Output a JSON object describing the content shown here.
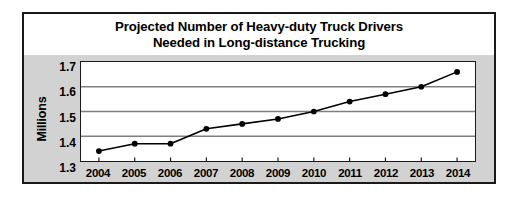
{
  "chart_data": {
    "type": "line",
    "title": "Projected Number of Heavy-duty Truck Drivers Needed in Long-distance Trucking",
    "title_lines": [
      "Projected Number of Heavy-duty Truck Drivers",
      "Needed in Long-distance Trucking"
    ],
    "xlabel": "",
    "ylabel": "Millions",
    "categories": [
      "2004",
      "2005",
      "2006",
      "2007",
      "2008",
      "2009",
      "2010",
      "2011",
      "2012",
      "2013",
      "2014"
    ],
    "values": [
      1.34,
      1.37,
      1.37,
      1.43,
      1.45,
      1.47,
      1.5,
      1.54,
      1.57,
      1.6,
      1.66
    ],
    "ylim": [
      1.3,
      1.7
    ],
    "yticks": [
      "1.3",
      "1.4",
      "1.5",
      "1.6",
      "1.7"
    ],
    "ytick_values": [
      1.3,
      1.4,
      1.5,
      1.6,
      1.7
    ],
    "grid": "horizontal",
    "legend": "none",
    "marker": "filled-circle",
    "series": [
      {
        "name": "Projected heavy-duty truck drivers",
        "values": [
          1.34,
          1.37,
          1.37,
          1.43,
          1.45,
          1.47,
          1.5,
          1.54,
          1.57,
          1.6,
          1.66
        ]
      }
    ],
    "colors": {
      "line": "#000000",
      "marker": "#000000",
      "grid": "#808080",
      "plot_background": "#ffffff",
      "figure_background": "#d2d2d2",
      "border": "#1a1a1a",
      "text": "#000000"
    }
  }
}
